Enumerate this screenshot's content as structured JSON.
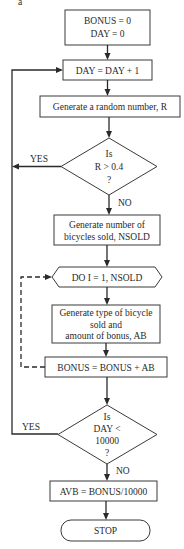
{
  "figure_label": "a",
  "flowchart": {
    "init": {
      "line1": "BONUS = 0",
      "line2": "DAY = 0"
    },
    "increment_day": "DAY = DAY + 1",
    "random_number": "Generate a random number, R",
    "decision_r": {
      "line1": "Is",
      "line2": "R > 0.4",
      "line3": "?",
      "yes_label": "YES",
      "no_label": "NO"
    },
    "generate_nsold": {
      "line1": "Generate number of",
      "line2": "bicycles sold, NSOLD"
    },
    "do_loop": "DO I = 1, NSOLD",
    "generate_type": {
      "line1": "Generate type of bicycle",
      "line2": "sold and",
      "line3": "amount of bonus, AB"
    },
    "accumulate_bonus": "BONUS = BONUS + AB",
    "decision_day": {
      "line1": "Is",
      "line2": "DAY <",
      "line3": "10000",
      "line4": "?",
      "yes_label": "YES",
      "no_label": "NO"
    },
    "average": "AVB = BONUS/10000",
    "stop": "STOP"
  }
}
